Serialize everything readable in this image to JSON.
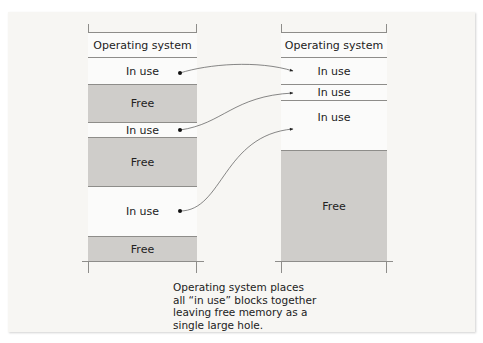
{
  "diagram": {
    "before": {
      "blocks": [
        {
          "label": "Operating system",
          "type": "os"
        },
        {
          "label": "In use",
          "type": "inuse"
        },
        {
          "label": "Free",
          "type": "free"
        },
        {
          "label": "In use",
          "type": "inuse"
        },
        {
          "label": "Free",
          "type": "free"
        },
        {
          "label": "In use",
          "type": "inuse"
        },
        {
          "label": "Free",
          "type": "free"
        }
      ]
    },
    "after": {
      "blocks": [
        {
          "label": "Operating system",
          "type": "os"
        },
        {
          "label": "In use",
          "type": "inuse"
        },
        {
          "label": "In use",
          "type": "inuse"
        },
        {
          "label": "In use",
          "type": "inuse"
        },
        {
          "label": "Free",
          "type": "free"
        }
      ]
    },
    "caption": "Operating system places all “in use” blocks together leaving free memory as a single large hole.",
    "caption_lines": [
      "Operating system places",
      "all “in use” blocks together",
      "leaving free memory as a",
      "single large hole."
    ],
    "colors": {
      "background": "#f7f6f3",
      "free": "#cfcdca",
      "in_use": "#fbfbfa",
      "border": "#8e8d8a"
    }
  }
}
